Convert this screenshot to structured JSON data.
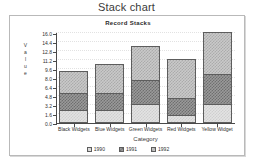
{
  "page": {
    "main_title": "Stack chart"
  },
  "chart_data": {
    "type": "bar",
    "stacked": true,
    "title": "Record Stacks",
    "xlabel": "Category",
    "ylabel": "Value",
    "ylabel_letters": [
      "V",
      "a",
      "l",
      "u",
      "e"
    ],
    "categories": [
      "Black Widgets",
      "Blue Widgets",
      "Green Widgets",
      "Red Widgets",
      "Yellow Widget"
    ],
    "series": [
      {
        "name": "1990",
        "values": [
          2.1,
          2.1,
          3.2,
          1.3,
          3.2
        ]
      },
      {
        "name": "1991",
        "values": [
          3.1,
          3.1,
          4.3,
          2.9,
          5.4
        ]
      },
      {
        "name": "1992",
        "values": [
          3.9,
          5.1,
          6.1,
          7.0,
          7.4
        ]
      }
    ],
    "totals": [
      9.1,
      10.3,
      13.6,
      11.2,
      16.0
    ],
    "ylim": [
      0.0,
      16.0
    ],
    "ytick_labels": [
      "0.0",
      "1.6",
      "3.2",
      "4.8",
      "6.4",
      "8.0",
      "9.6",
      "11.2",
      "12.8",
      "14.4",
      "16.0"
    ],
    "ytick_values": [
      0.0,
      1.6,
      3.2,
      4.8,
      6.4,
      8.0,
      9.6,
      11.2,
      12.8,
      14.4,
      16.0
    ],
    "grid": true,
    "legend_position": "bottom",
    "legend": [
      "1990",
      "1991",
      "1992"
    ],
    "colors": {
      "series_1990": "#e3e3e3",
      "series_1991": "#9a9a9a",
      "series_1992": "#c9c9c9",
      "axis": "#4a4a4a",
      "border": "#5d5d5d",
      "background": "#ffffff"
    }
  }
}
